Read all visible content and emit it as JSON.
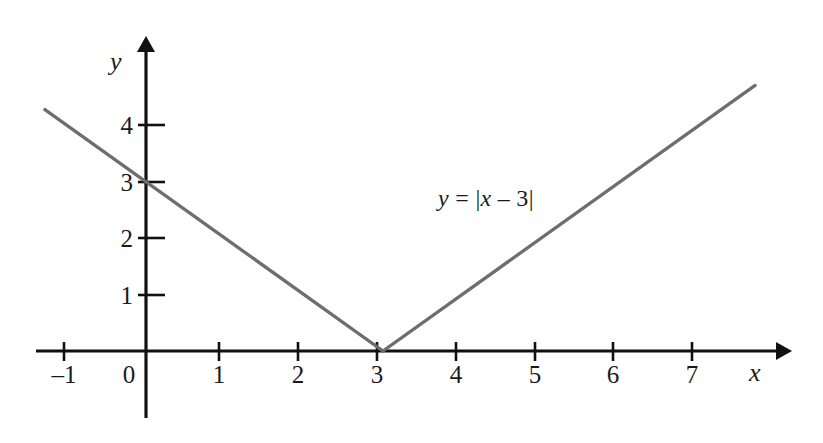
{
  "figure": {
    "background_color": "#ffffff",
    "axis_color": "#111111",
    "curve_color": "#6e6e6e",
    "label_color": "#1a1a1a"
  },
  "axes": {
    "x_name": "x",
    "y_name": "y",
    "origin_label": "0",
    "x_tick_labels": [
      "–1",
      "1",
      "2",
      "3",
      "4",
      "5",
      "6",
      "7"
    ],
    "y_tick_labels": [
      "1",
      "2",
      "3",
      "4"
    ]
  },
  "annotation": {
    "equation_y": "y",
    "equation_eq": " = |",
    "equation_x": "x",
    "equation_tail": " – 3|",
    "equation_full": "y = |x – 3|"
  },
  "chart_data": {
    "type": "line",
    "title": "",
    "subtitle": "",
    "xlabel": "x",
    "ylabel": "y",
    "xlim": [
      -1.4,
      8.3
    ],
    "ylim": [
      -0.5,
      5.5
    ],
    "xticks": [
      -1,
      1,
      2,
      3,
      4,
      5,
      6,
      7
    ],
    "xticklabels": [
      "–1",
      "1",
      "2",
      "3",
      "4",
      "5",
      "6",
      "7"
    ],
    "yticks": [
      1,
      2,
      3,
      4
    ],
    "yticklabels": [
      "1",
      "2",
      "3",
      "4"
    ],
    "grid": false,
    "legend": null,
    "annotations": [
      {
        "text": "y = |x – 3|",
        "x": 4.8,
        "y": 2.6
      }
    ],
    "series": [
      {
        "name": "y = |x - 3|",
        "equation": "y = |x - 3|",
        "color": "#6e6e6e",
        "vertex": [
          3,
          0
        ],
        "x": [
          -1.28,
          3,
          7.71
        ],
        "y": [
          4.28,
          0,
          4.71
        ],
        "points": [
          {
            "x": -1.28,
            "y": 4.28
          },
          {
            "x": -1,
            "y": 4
          },
          {
            "x": 0,
            "y": 3
          },
          {
            "x": 1,
            "y": 2
          },
          {
            "x": 2,
            "y": 1
          },
          {
            "x": 3,
            "y": 0
          },
          {
            "x": 4,
            "y": 1
          },
          {
            "x": 5,
            "y": 2
          },
          {
            "x": 6,
            "y": 3
          },
          {
            "x": 7,
            "y": 4
          },
          {
            "x": 7.71,
            "y": 4.71
          }
        ]
      }
    ]
  }
}
